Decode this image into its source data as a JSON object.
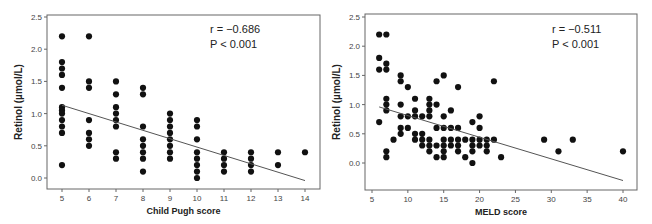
{
  "chart_data": [
    {
      "type": "scatter",
      "title": "",
      "xlabel": "Child Pugh score",
      "ylabel": "Retinol (µmol/L)",
      "xlim": [
        4.45,
        14.7
      ],
      "ylim": [
        -0.12,
        2.55
      ],
      "xticks": [
        5,
        6,
        7,
        8,
        9,
        10,
        11,
        12,
        13,
        14
      ],
      "yticks": [
        0.0,
        0.5,
        1.0,
        1.5,
        2.0,
        2.5
      ],
      "ytick_labels": [
        "0.0",
        "0.5",
        "1.0",
        "1.5",
        "2.0",
        "2.5"
      ],
      "annotation": {
        "r": "r = −0.686",
        "p": "P < 0.001"
      },
      "regression_line": {
        "x": [
          5,
          14
        ],
        "y": [
          1.13,
          -0.04
        ]
      },
      "points": [
        [
          5,
          2.2
        ],
        [
          5,
          1.8
        ],
        [
          5,
          1.7
        ],
        [
          5,
          1.6
        ],
        [
          5,
          1.4
        ],
        [
          5,
          1.1
        ],
        [
          5,
          1.05
        ],
        [
          5,
          1.0
        ],
        [
          5,
          0.9
        ],
        [
          5,
          0.8
        ],
        [
          5,
          0.7
        ],
        [
          5,
          0.2
        ],
        [
          6,
          2.2
        ],
        [
          6,
          1.5
        ],
        [
          6,
          1.4
        ],
        [
          6,
          0.9
        ],
        [
          6,
          0.7
        ],
        [
          6,
          0.6
        ],
        [
          6,
          0.5
        ],
        [
          7,
          1.5
        ],
        [
          7,
          1.3
        ],
        [
          7,
          1.1
        ],
        [
          7,
          1.0
        ],
        [
          7,
          0.9
        ],
        [
          7,
          0.8
        ],
        [
          7,
          0.4
        ],
        [
          7,
          0.3
        ],
        [
          8,
          1.4
        ],
        [
          8,
          1.3
        ],
        [
          8,
          0.8
        ],
        [
          8,
          0.6
        ],
        [
          8,
          0.5
        ],
        [
          8,
          0.4
        ],
        [
          8,
          0.3
        ],
        [
          8,
          0.1
        ],
        [
          9,
          1.0
        ],
        [
          9,
          0.9
        ],
        [
          9,
          0.8
        ],
        [
          9,
          0.7
        ],
        [
          9,
          0.6
        ],
        [
          9,
          0.5
        ],
        [
          9,
          0.4
        ],
        [
          9,
          0.3
        ],
        [
          10,
          0.9
        ],
        [
          10,
          0.8
        ],
        [
          10,
          0.6
        ],
        [
          10,
          0.4
        ],
        [
          10,
          0.3
        ],
        [
          10,
          0.2
        ],
        [
          10,
          0.1
        ],
        [
          10,
          0.0
        ],
        [
          11,
          0.4
        ],
        [
          11,
          0.3
        ],
        [
          11,
          0.2
        ],
        [
          11,
          0.1
        ],
        [
          12,
          0.4
        ],
        [
          12,
          0.3
        ],
        [
          12,
          0.2
        ],
        [
          12,
          0.1
        ],
        [
          13,
          0.4
        ],
        [
          13,
          0.2
        ],
        [
          14,
          0.4
        ]
      ]
    },
    {
      "type": "scatter",
      "title": "",
      "xlabel": "MELD score",
      "ylabel": "Retinol (µmol/L)",
      "xlim": [
        4,
        42
      ],
      "ylim": [
        -0.45,
        2.55
      ],
      "xticks": [
        5,
        10,
        15,
        20,
        25,
        30,
        35,
        40
      ],
      "yticks": [
        0.0,
        0.5,
        1.0,
        1.5,
        2.0,
        2.5
      ],
      "ytick_labels": [
        "0.0",
        "0.5",
        "1.0",
        "1.5",
        "2.0",
        "2.5"
      ],
      "annotation": {
        "r": "r = −0.511",
        "p": "P < 0.001"
      },
      "regression_line": {
        "x": [
          6,
          40
        ],
        "y": [
          0.96,
          -0.3
        ]
      },
      "points": [
        [
          6,
          2.2
        ],
        [
          6,
          1.8
        ],
        [
          6,
          1.6
        ],
        [
          6,
          0.7
        ],
        [
          7,
          2.2
        ],
        [
          7,
          1.7
        ],
        [
          7,
          1.6
        ],
        [
          7,
          1.1
        ],
        [
          7,
          1.0
        ],
        [
          7,
          0.9
        ],
        [
          7,
          0.2
        ],
        [
          7,
          0.1
        ],
        [
          8,
          0.4
        ],
        [
          9,
          1.5
        ],
        [
          9,
          1.4
        ],
        [
          9,
          1.0
        ],
        [
          9,
          0.8
        ],
        [
          9,
          0.6
        ],
        [
          9,
          0.5
        ],
        [
          10,
          1.3
        ],
        [
          10,
          0.8
        ],
        [
          10,
          0.6
        ],
        [
          11,
          1.1
        ],
        [
          11,
          0.9
        ],
        [
          11,
          0.8
        ],
        [
          11,
          0.5
        ],
        [
          11,
          0.4
        ],
        [
          12,
          0.8
        ],
        [
          12,
          0.5
        ],
        [
          12,
          0.4
        ],
        [
          12,
          0.3
        ],
        [
          13,
          1.1
        ],
        [
          13,
          1.0
        ],
        [
          13,
          0.9
        ],
        [
          13,
          0.8
        ],
        [
          13,
          0.4
        ],
        [
          13,
          0.3
        ],
        [
          13,
          0.2
        ],
        [
          14,
          1.4
        ],
        [
          14,
          1.0
        ],
        [
          14,
          0.6
        ],
        [
          14,
          0.3
        ],
        [
          14,
          0.1
        ],
        [
          15,
          1.5
        ],
        [
          15,
          0.8
        ],
        [
          15,
          0.6
        ],
        [
          15,
          0.4
        ],
        [
          15,
          0.3
        ],
        [
          15,
          0.2
        ],
        [
          15,
          0.1
        ],
        [
          16,
          0.9
        ],
        [
          16,
          0.6
        ],
        [
          16,
          0.4
        ],
        [
          16,
          0.3
        ],
        [
          17,
          1.3
        ],
        [
          17,
          0.6
        ],
        [
          17,
          0.4
        ],
        [
          17,
          0.3
        ],
        [
          17,
          0.2
        ],
        [
          18,
          0.4
        ],
        [
          18,
          0.1
        ],
        [
          19,
          0.7
        ],
        [
          19,
          0.4
        ],
        [
          19,
          0.3
        ],
        [
          19,
          0.2
        ],
        [
          19,
          0.0
        ],
        [
          20,
          0.8
        ],
        [
          20,
          0.6
        ],
        [
          20,
          0.4
        ],
        [
          20,
          0.3
        ],
        [
          21,
          0.4
        ],
        [
          21,
          0.3
        ],
        [
          21,
          0.2
        ],
        [
          22,
          1.4
        ],
        [
          22,
          0.4
        ],
        [
          23,
          0.1
        ],
        [
          29,
          0.4
        ],
        [
          31,
          0.2
        ],
        [
          33,
          0.4
        ],
        [
          40,
          0.2
        ]
      ]
    }
  ]
}
